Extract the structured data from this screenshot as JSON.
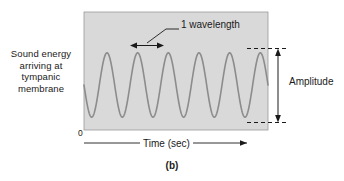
{
  "figure": {
    "caption": "(b)",
    "y_axis_label": "Sound energy arriving at tympanic membrane",
    "x_axis_label": "Time (sec)",
    "origin_label": "0",
    "annotations": {
      "wavelength": "1 wavelength",
      "amplitude": "Amplitude"
    },
    "colors": {
      "plot_background": "#d9d9d9",
      "wave_stroke": "#8c8c8c",
      "annotation": "#1a1a1a",
      "page_background": "#ffffff"
    }
  },
  "chart_data": {
    "type": "line",
    "title": "",
    "subtitle": "",
    "xlabel": "Time (sec)",
    "ylabel": "Sound energy arriving at tympanic membrane",
    "grid": false,
    "legend": "none",
    "waveform": "sine",
    "cycles": 6,
    "amplitude": 1.0,
    "xlim": [
      0,
      6
    ],
    "ylim": [
      -1.15,
      1.15
    ],
    "xticks": [
      "0"
    ],
    "yticks": [],
    "annotations": [
      {
        "text": "1 wavelength",
        "type": "double-arrow-horizontal",
        "x_start": 1.0,
        "x_end": 2.0,
        "y": 1.0
      },
      {
        "text": "Amplitude",
        "type": "double-arrow-vertical",
        "y_start": 1.0,
        "y_end": -1.0,
        "x": 6.45
      }
    ],
    "series": [
      {
        "name": "Sound pressure wave",
        "x": [
          0,
          0.25,
          0.5,
          0.75,
          1,
          1.25,
          1.5,
          1.75,
          2,
          2.25,
          2.5,
          2.75,
          3,
          3.25,
          3.5,
          3.75,
          4,
          4.25,
          4.5,
          4.75,
          5,
          5.25,
          5.5,
          5.75,
          6
        ],
        "values": [
          0,
          -1,
          0,
          1,
          0,
          -1,
          0,
          1,
          0,
          -1,
          0,
          1,
          0,
          -1,
          0,
          1,
          0,
          -1,
          0,
          1,
          0,
          -1,
          0,
          1,
          0
        ]
      }
    ]
  }
}
